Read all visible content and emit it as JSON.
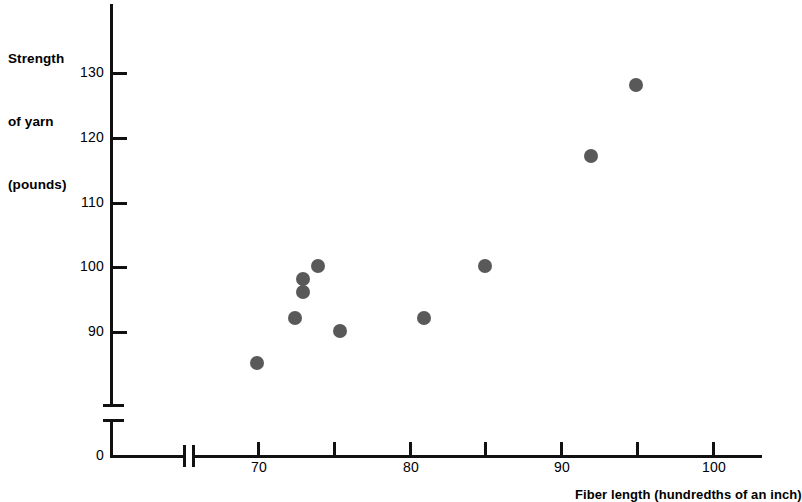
{
  "chart_data": {
    "type": "scatter",
    "title": "",
    "ylabel": "Strength of yarn (pounds)",
    "xlabel": "Fiber length (hundredths of an inch)",
    "ylabel_lines": [
      "Strength",
      "of yarn",
      "(pounds)"
    ],
    "xlim": [
      65,
      103
    ],
    "ylim": [
      82,
      134
    ],
    "grid": false,
    "legend": "none",
    "x_ticks": [
      70,
      75,
      80,
      85,
      90,
      95,
      100
    ],
    "x_tick_labels": [
      "70",
      "",
      "80",
      "",
      "90",
      "",
      "100"
    ],
    "y_ticks": [
      90,
      100,
      110,
      120,
      130
    ],
    "y_tick_labels": [
      "90",
      "100",
      "110",
      "120",
      "130"
    ],
    "origin_label": "0",
    "axis_break_x": true,
    "axis_break_y": true,
    "point_color": "#595959",
    "axis_color": "#111111",
    "x": [
      70,
      72.5,
      73,
      73,
      74,
      75.5,
      81,
      85,
      92,
      95
    ],
    "y": [
      85,
      92,
      96,
      98,
      100,
      90,
      92,
      100,
      117,
      128
    ],
    "points": [
      {
        "x": 70,
        "y": 85
      },
      {
        "x": 72.5,
        "y": 92
      },
      {
        "x": 73,
        "y": 96
      },
      {
        "x": 73,
        "y": 98
      },
      {
        "x": 74,
        "y": 100
      },
      {
        "x": 75.5,
        "y": 90
      },
      {
        "x": 81,
        "y": 92
      },
      {
        "x": 85,
        "y": 100
      },
      {
        "x": 92,
        "y": 117
      },
      {
        "x": 95,
        "y": 128
      }
    ]
  },
  "axes": {
    "y_title_line1": "Strength",
    "y_title_line2": "of yarn",
    "y_title_line3": "(pounds)",
    "x_title": "Fiber length (hundredths of an inch)",
    "origin": "0",
    "y_labels": [
      "130",
      "120",
      "110",
      "100",
      "90"
    ],
    "x_labels": [
      "70",
      "80",
      "90",
      "100"
    ]
  }
}
